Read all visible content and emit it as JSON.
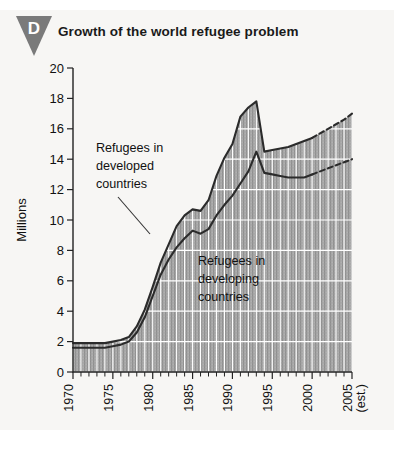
{
  "badge": {
    "letter": "D"
  },
  "header": {
    "title": "Growth of the world refugee problem"
  },
  "annotations": {
    "developed": [
      "Refugees in",
      "developed",
      "countries"
    ],
    "developing": [
      "Refugees in",
      "developing",
      "countries"
    ]
  },
  "colors": {
    "page_background": "#f7f6f4",
    "badge": "#7a7a7a",
    "line": "#2b2b2b",
    "fill_gray": "#a8a8a8",
    "gridline": "#ffffff",
    "text": "#111111"
  },
  "chart_data": {
    "type": "area",
    "title": "Growth of the world refugee problem",
    "xlabel": "",
    "ylabel": "Millions",
    "ylim": [
      0,
      20
    ],
    "ytick_step": 2,
    "yticks": [
      0,
      2,
      4,
      6,
      8,
      10,
      12,
      14,
      16,
      18,
      20
    ],
    "xlim": [
      1970,
      2005
    ],
    "xtick_step": 1,
    "xtick_labels": [
      "1970",
      "1975",
      "1980",
      "1985",
      "1990",
      "1995",
      "2000",
      "2005"
    ],
    "xtick_label_years": [
      1970,
      1975,
      1980,
      1985,
      1990,
      1995,
      2000,
      2005
    ],
    "xtick_label_suffix": "(est.)",
    "grid": true,
    "stacked": true,
    "legend_position": "inline-annotations",
    "x": [
      1970,
      1971,
      1972,
      1973,
      1974,
      1975,
      1976,
      1977,
      1978,
      1979,
      1980,
      1981,
      1982,
      1983,
      1984,
      1985,
      1986,
      1987,
      1988,
      1989,
      1990,
      1991,
      1992,
      1993,
      1994,
      1995,
      1996,
      1997,
      1998,
      1999,
      2000,
      2001,
      2002,
      2003,
      2004,
      2005
    ],
    "series": [
      {
        "name": "Refugees in developing countries",
        "values": [
          1.6,
          1.6,
          1.6,
          1.6,
          1.6,
          1.7,
          1.8,
          2.0,
          2.6,
          3.6,
          5.0,
          6.4,
          7.4,
          8.2,
          8.8,
          9.3,
          9.1,
          9.4,
          10.3,
          11.0,
          11.6,
          12.4,
          13.2,
          14.5,
          13.1,
          13.0,
          12.9,
          12.8,
          12.8,
          12.8,
          13.0,
          13.2,
          13.4,
          13.6,
          13.8,
          14.0
        ],
        "estimated_from_year": 2000
      },
      {
        "name": "Refugees in developed countries",
        "values": [
          0.3,
          0.3,
          0.3,
          0.3,
          0.3,
          0.3,
          0.3,
          0.3,
          0.4,
          0.5,
          0.6,
          0.8,
          1.0,
          1.4,
          1.5,
          1.4,
          1.5,
          1.9,
          2.6,
          3.1,
          3.4,
          4.4,
          4.2,
          3.3,
          1.4,
          1.6,
          1.8,
          2.0,
          2.2,
          2.4,
          2.4,
          2.5,
          2.6,
          2.7,
          2.8,
          3.0
        ],
        "estimated_from_year": 2000
      }
    ],
    "total": {
      "name": "Total refugees",
      "values": [
        1.9,
        1.9,
        1.9,
        1.9,
        1.9,
        2.0,
        2.1,
        2.3,
        3.0,
        4.1,
        5.6,
        7.2,
        8.4,
        9.6,
        10.3,
        10.7,
        10.6,
        11.3,
        12.9,
        14.1,
        15.0,
        16.8,
        17.4,
        17.8,
        14.5,
        14.6,
        14.7,
        14.8,
        15.0,
        15.2,
        15.4,
        15.7,
        16.0,
        16.3,
        16.6,
        17.0
      ],
      "peak_year": 1993,
      "peak_value": 17.8
    }
  }
}
